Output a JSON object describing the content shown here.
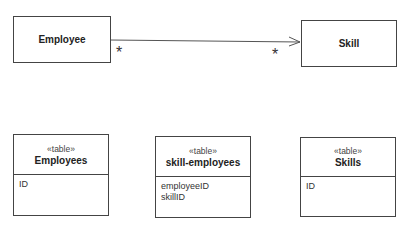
{
  "classes": {
    "employee": {
      "name": "Employee"
    },
    "skill": {
      "name": "Skill"
    }
  },
  "association": {
    "source_multiplicity": "*",
    "target_multiplicity": "*",
    "navigability": "Employee to Skill"
  },
  "tables": [
    {
      "stereotype": "«table»",
      "name": "Employees",
      "columns": [
        "ID"
      ]
    },
    {
      "stereotype": "«table»",
      "name": "skill-employees",
      "columns": [
        "employeeID",
        "skillID"
      ]
    },
    {
      "stereotype": "«table»",
      "name": "Skills",
      "columns": [
        "ID"
      ]
    }
  ],
  "caption": {
    "text": ""
  }
}
